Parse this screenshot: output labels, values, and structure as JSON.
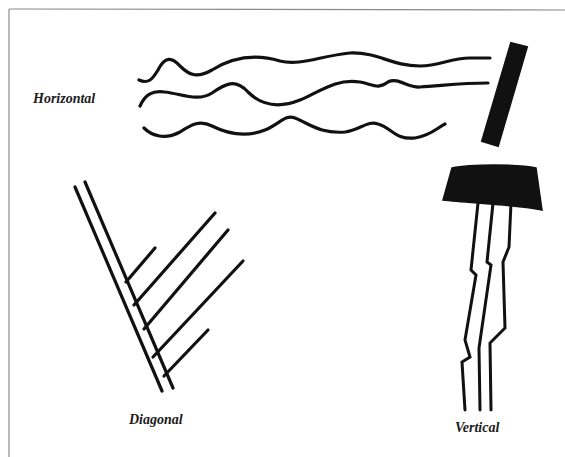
{
  "diagram": {
    "labels": {
      "horizontal": "Horizontal",
      "diagonal": "Diagonal",
      "vertical": "Vertical"
    },
    "colors": {
      "ink": "#111111",
      "background": "#ffffff",
      "border": "#888888"
    },
    "figures": [
      {
        "name": "horizontal",
        "description": "three wavy strands attached to a slanted bar on the right"
      },
      {
        "name": "diagonal",
        "description": "two long parallel diagonal lines with five short parallel branches"
      },
      {
        "name": "vertical",
        "description": "three jagged vertical strands hanging from a dark block"
      }
    ]
  }
}
